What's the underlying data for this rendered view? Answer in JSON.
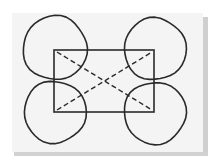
{
  "diagram": {
    "colors": {
      "ink": "#2a2a2a",
      "paper": "#f4f4f4",
      "shadow": "#cfcfcf",
      "background": "#ffffff"
    },
    "rectangle": {
      "x": 54,
      "y": 50,
      "width": 100,
      "height": 62
    },
    "circles": [
      {
        "id": "top-left",
        "cx": 55,
        "cy": 48,
        "r": 32
      },
      {
        "id": "top-right",
        "cx": 155,
        "cy": 49,
        "r": 31
      },
      {
        "id": "bottom-left",
        "cx": 55,
        "cy": 112,
        "r": 31
      },
      {
        "id": "bottom-right",
        "cx": 155,
        "cy": 113,
        "r": 31
      }
    ],
    "diagonals": [
      {
        "id": "tl-to-br",
        "x1": 57,
        "y1": 52,
        "x2": 152,
        "y2": 110,
        "style": "dashed"
      },
      {
        "id": "bl-to-tr",
        "x1": 57,
        "y1": 110,
        "x2": 152,
        "y2": 52,
        "style": "dashed"
      }
    ]
  }
}
